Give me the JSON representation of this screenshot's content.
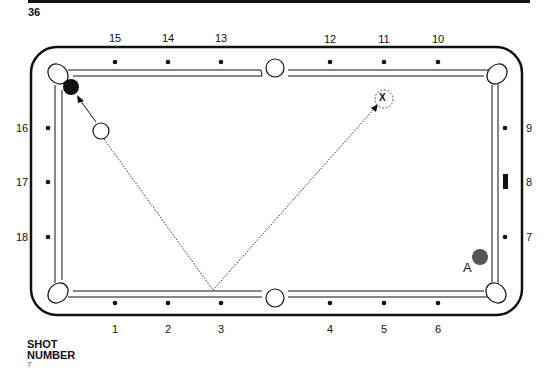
{
  "page": {
    "number": "36"
  },
  "table": {
    "top_diamond_labels": [
      {
        "label": "15",
        "x": 115
      },
      {
        "label": "14",
        "x": 168
      },
      {
        "label": "13",
        "x": 221
      },
      {
        "label": "12",
        "x": 330
      },
      {
        "label": "11",
        "x": 384
      },
      {
        "label": "10",
        "x": 438
      }
    ],
    "bottom_diamond_labels": [
      {
        "label": "1",
        "x": 115
      },
      {
        "label": "2",
        "x": 168
      },
      {
        "label": "3",
        "x": 221
      },
      {
        "label": "4",
        "x": 330
      },
      {
        "label": "5",
        "x": 384
      },
      {
        "label": "6",
        "x": 438
      }
    ],
    "left_diamond_labels": [
      {
        "label": "16",
        "y": 128
      },
      {
        "label": "17",
        "y": 182
      },
      {
        "label": "18",
        "y": 237
      }
    ],
    "right_diamond_labels": [
      {
        "label": "9",
        "y": 128
      },
      {
        "label": "8",
        "y": 182
      },
      {
        "label": "7",
        "y": 237
      }
    ]
  },
  "balls": {
    "object_ball": {
      "color": "#111111"
    },
    "cue_ball": {
      "color": "#ffffff"
    },
    "target": {
      "label": "X"
    },
    "ball_a": {
      "label": "A",
      "color": "#555555"
    }
  },
  "footer": {
    "shot_label_line1": "SHOT",
    "shot_label_line2": "NUMBER",
    "shot_number": "7"
  }
}
